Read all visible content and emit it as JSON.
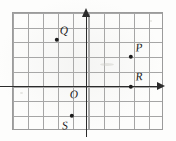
{
  "figure": {
    "name": "coordinate-plane-diagram",
    "type": "cartesian-grid",
    "grid": {
      "columns": 10,
      "rows": 8,
      "cell_size_px": 15,
      "left_px": 12,
      "top_px": 12,
      "width_px": 151,
      "height_px": 118,
      "line_color": "#9a9a9a",
      "border_color": "#8e8e8e"
    },
    "axes": {
      "color": "#2b2b2b",
      "origin_label": "O",
      "origin_px": {
        "x": 87,
        "y": 87
      },
      "x_axis": {
        "arrow": "right",
        "y_px": 87
      },
      "y_axis": {
        "arrow": "up",
        "x_px": 87
      }
    },
    "points": [
      {
        "label": "Q",
        "x": -2,
        "y": 3,
        "px": 57,
        "py": 40,
        "label_px": 64,
        "label_py": 31
      },
      {
        "label": "P",
        "x": 3,
        "y": 2,
        "px": 131,
        "py": 57,
        "label_px": 139,
        "label_py": 48
      },
      {
        "label": "R",
        "x": 3,
        "y": 0,
        "px": 131,
        "py": 87,
        "label_px": 139,
        "label_py": 77
      },
      {
        "label": "S",
        "x": -1,
        "y": -2,
        "px": 72,
        "py": 116,
        "label_px": 65,
        "label_py": 126
      }
    ]
  }
}
